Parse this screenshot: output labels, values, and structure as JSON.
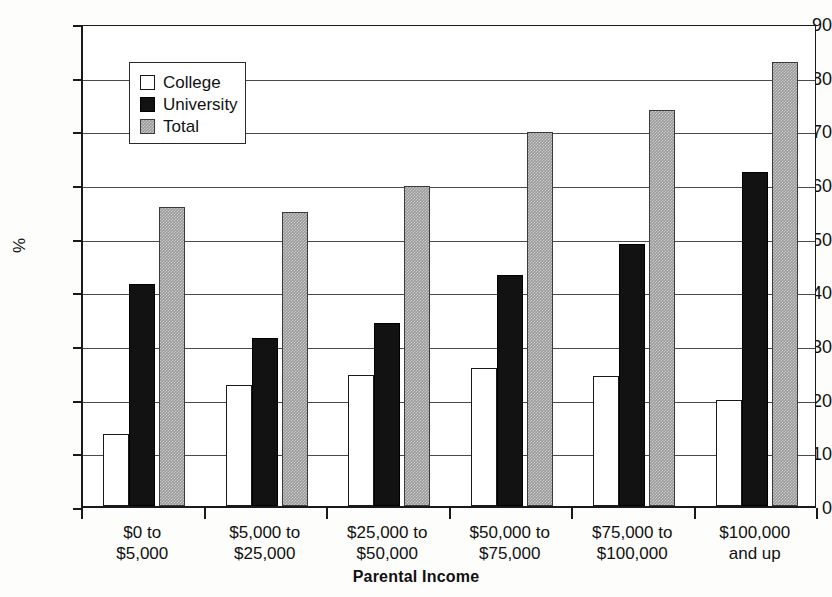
{
  "chart_data": {
    "type": "bar",
    "title": "",
    "xlabel": "Parental Income",
    "ylabel": "%",
    "ylim": [
      0,
      90
    ],
    "yticks": [
      0,
      10,
      20,
      30,
      40,
      50,
      60,
      70,
      80,
      90
    ],
    "grid": true,
    "legend_position": "upper-left-inside",
    "categories": [
      "$0 to\n$5,000",
      "$5,000 to\n$25,000",
      "$25,000 to\n$50,000",
      "$50,000 to\n$75,000",
      "$75,000 to\n$100,000",
      "$100,000\nand up"
    ],
    "category_lines": [
      [
        "$0 to",
        "$5,000"
      ],
      [
        "$5,000 to",
        "$25,000"
      ],
      [
        "$25,000 to",
        "$50,000"
      ],
      [
        "$50,000 to",
        "$75,000"
      ],
      [
        "$75,000 to",
        "$100,000"
      ],
      [
        "$100,000",
        "and up"
      ]
    ],
    "series": [
      {
        "name": "College",
        "color": "#ffffff",
        "values": [
          13.5,
          22.5,
          24.5,
          25.7,
          24.2,
          19.8
        ]
      },
      {
        "name": "University",
        "color": "#121212",
        "values": [
          41.3,
          31.4,
          34.1,
          43.0,
          48.8,
          62.2
        ]
      },
      {
        "name": "Total",
        "color": "#9a9a9a",
        "values": [
          55.7,
          54.7,
          59.7,
          69.7,
          73.7,
          82.8
        ]
      }
    ]
  },
  "legend": {
    "items": [
      {
        "label": "College",
        "swatch": "college"
      },
      {
        "label": "University",
        "swatch": "university"
      },
      {
        "label": "Total",
        "swatch": "total"
      }
    ]
  },
  "axes": {
    "y_title": "%",
    "x_title": "Parental Income"
  }
}
